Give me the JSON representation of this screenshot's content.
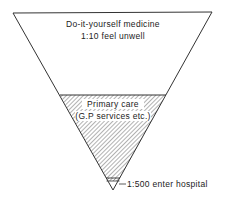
{
  "diagram": {
    "type": "inverted-triangle",
    "levels": [
      {
        "title": "Do-it-yourself medicine",
        "subtitle": "1:10 feel unwell"
      },
      {
        "title": "Primary care",
        "subtitle": "(G.P services etc.)"
      },
      {
        "title": "1:500 enter hospital"
      }
    ],
    "colors": {
      "line": "#333333",
      "hatch": "#555555",
      "background": "#ffffff"
    }
  }
}
